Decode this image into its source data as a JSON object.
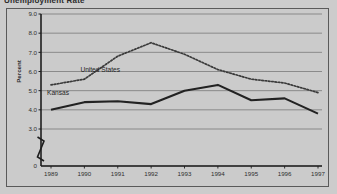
{
  "figure": {
    "title": "Unemployment Rate",
    "background_color": "#cccccc",
    "border_color": "#5a5a5a"
  },
  "chart_data": {
    "type": "line",
    "title": "Unemployment Rate",
    "xlabel": "",
    "ylabel": "Percent",
    "categories": [
      "1989",
      "1990",
      "1991",
      "1992",
      "1993",
      "1994",
      "1995",
      "1996",
      "1997"
    ],
    "ylim": [
      3.0,
      9.0
    ],
    "y_axis_break": true,
    "y_ticks": [
      "0",
      "3.0",
      "4.0",
      "5.0",
      "6.0",
      "7.0",
      "8.0",
      "9.0"
    ],
    "grid": true,
    "legend_position": "inline-annotation",
    "series": [
      {
        "name": "United States",
        "style": "dotted",
        "color": "#3a3a3a",
        "values": [
          5.3,
          5.6,
          6.8,
          7.5,
          6.9,
          6.1,
          5.6,
          5.4,
          4.9
        ]
      },
      {
        "name": "Kansas",
        "style": "solid",
        "color": "#222222",
        "values": [
          4.0,
          4.4,
          4.45,
          4.3,
          5.0,
          5.3,
          4.5,
          4.6,
          3.8
        ]
      }
    ],
    "annotations": [
      {
        "text": "United States",
        "x": "1990",
        "y": 6.1
      },
      {
        "text": "Kansas",
        "x": "1989",
        "y": 4.9
      }
    ]
  }
}
